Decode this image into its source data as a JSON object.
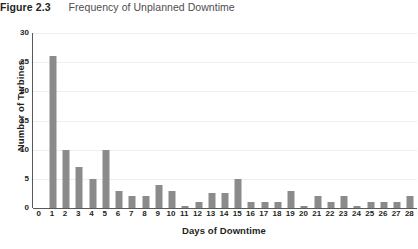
{
  "figure": {
    "number": "Figure 2.3",
    "title": "Frequency of Unplanned Downtime"
  },
  "chart_data": {
    "type": "bar",
    "title": "Frequency of Unplanned Downtime",
    "xlabel": "Days of Downtime",
    "ylabel": "Number of Turbines",
    "categories": [
      0,
      1,
      2,
      3,
      4,
      5,
      6,
      7,
      8,
      9,
      10,
      11,
      12,
      13,
      14,
      15,
      16,
      17,
      18,
      19,
      20,
      21,
      22,
      23,
      24,
      25,
      26,
      27,
      28
    ],
    "values": [
      0,
      26,
      10,
      7,
      5,
      10,
      3,
      2,
      2,
      4,
      3,
      0.3,
      1,
      2.5,
      2.5,
      5,
      1,
      1,
      1,
      3,
      0.3,
      2,
      1,
      2,
      0.3,
      1,
      1,
      1,
      2
    ],
    "xlim": [
      0,
      28
    ],
    "ylim": [
      0,
      30
    ],
    "ytick_labels": [
      "0",
      "5",
      "10",
      "15",
      "20",
      "25",
      "30"
    ],
    "ytick_values": [
      0,
      5,
      10,
      15,
      20,
      25,
      30
    ],
    "xtick_labels": [
      "0",
      "1",
      "2",
      "3",
      "4",
      "5",
      "6",
      "7",
      "8",
      "9",
      "10",
      "11",
      "12",
      "13",
      "14",
      "15",
      "16",
      "17",
      "18",
      "19",
      "20",
      "21",
      "22",
      "23",
      "24",
      "25",
      "26",
      "27",
      "28"
    ],
    "grid": "horizontal",
    "legend": null,
    "bar_color": "#8b8b8b",
    "axis_color": "#58595b",
    "grid_color": "#efefef"
  }
}
